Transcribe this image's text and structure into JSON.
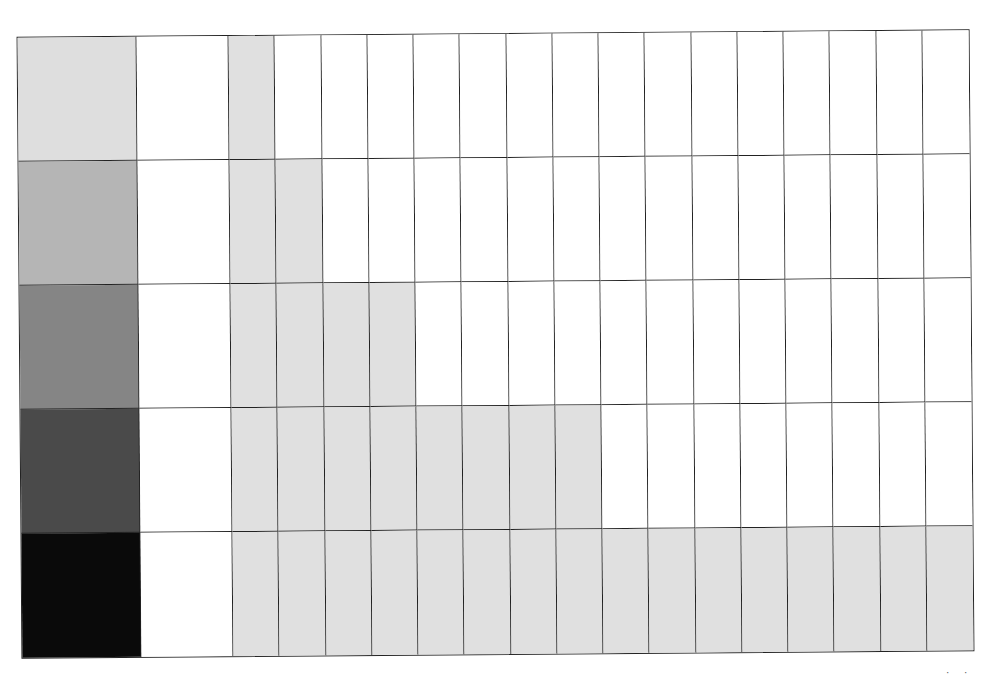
{
  "diagram": {
    "columns_total": 16,
    "rows": [
      {
        "swatch_color": "#dedede",
        "shaded_count": 1
      },
      {
        "swatch_color": "#b5b5b5",
        "shaded_count": 2
      },
      {
        "swatch_color": "#858585",
        "shaded_count": 4
      },
      {
        "swatch_color": "#4a4a4a",
        "shaded_count": 8
      },
      {
        "swatch_color": "#0a0a0a",
        "shaded_count": 16
      }
    ],
    "shaded_cell_color": "#e0e0e0",
    "corner_marks": "· ·"
  }
}
